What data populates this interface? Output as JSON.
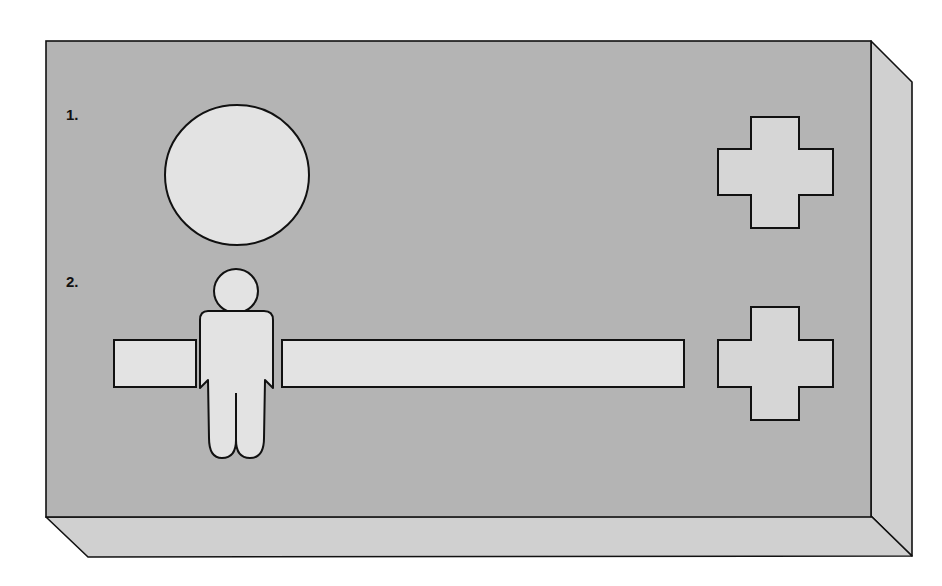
{
  "diagram": {
    "labels": {
      "step1": "1.",
      "step2": "2."
    },
    "colors": {
      "front_face": "#b4b4b4",
      "side_face": "#d0d0d0",
      "shape_fill": "#e3e3e3",
      "stroke": "#111111",
      "background": "#ffffff"
    },
    "rows": [
      {
        "label": "1.",
        "shapes": [
          "circle",
          "cross"
        ]
      },
      {
        "label": "2.",
        "shapes": [
          "rectangle",
          "person",
          "long-rectangle",
          "cross"
        ]
      }
    ]
  }
}
